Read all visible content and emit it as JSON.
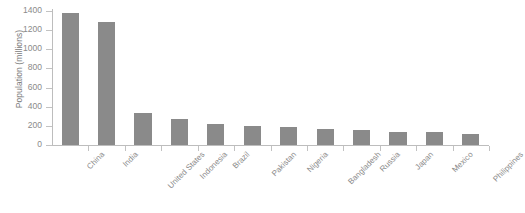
{
  "chart_data": {
    "type": "bar",
    "title": "",
    "xlabel": "",
    "ylabel": "Population (millions)",
    "ylim": [
      0,
      1400
    ],
    "yticks": [
      0,
      200,
      400,
      600,
      800,
      1000,
      1200,
      1400
    ],
    "ytick_labels": [
      "0",
      "200",
      "400",
      "600",
      "800",
      "1000",
      "1200",
      "1400"
    ],
    "grid": false,
    "legend": false,
    "bar_color": "#8a8a8a",
    "axis_color": "#bdbdbd",
    "text_color": "#8a8a8a",
    "xtick_label_rotation": -45,
    "categories": [
      "China",
      "India",
      "United States",
      "Indonesia",
      "Brazil",
      "Pakistan",
      "Nigeria",
      "Bangladesh",
      "Russia",
      "Japan",
      "Mexico",
      "Philippines"
    ],
    "values": [
      1380,
      1290,
      330,
      270,
      215,
      200,
      190,
      165,
      155,
      140,
      135,
      110
    ]
  }
}
